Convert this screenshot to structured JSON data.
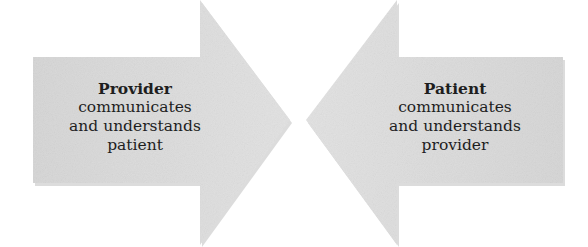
{
  "diagram": {
    "arrows": [
      {
        "direction": "right",
        "title": "Provider",
        "lines": [
          "communicates",
          "and understands",
          "patient"
        ]
      },
      {
        "direction": "left",
        "title": "Patient",
        "lines": [
          "communicates",
          "and understands",
          "provider"
        ]
      }
    ],
    "colors": {
      "arrow_fill": "#dcdcdc",
      "arrow_shadow": "#b5b5b5",
      "text": "#1e1e1e"
    }
  }
}
